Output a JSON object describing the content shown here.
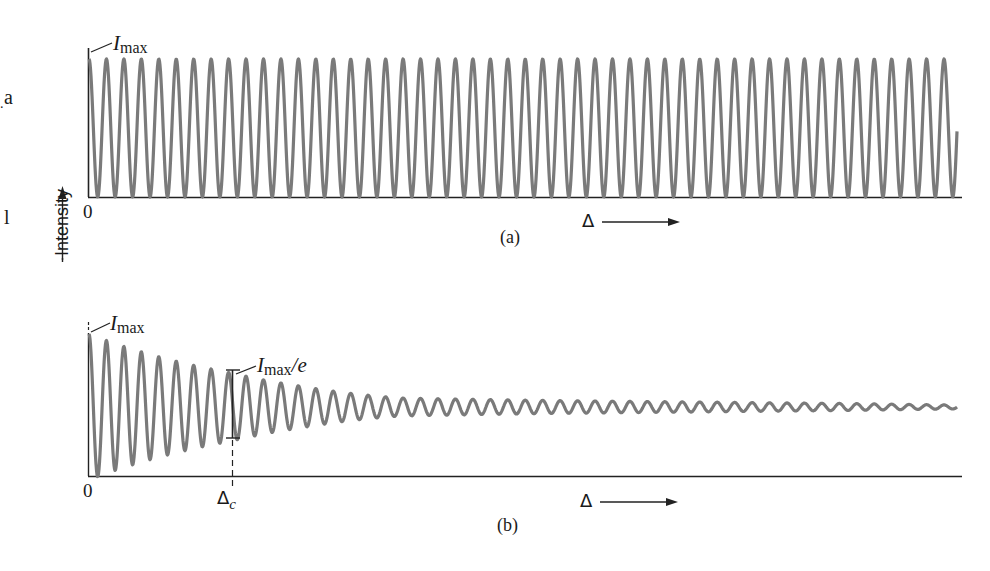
{
  "figure": {
    "y_axis_label": "Intensity",
    "margin_fragments": [
      "a",
      ".",
      "l"
    ],
    "panels": [
      {
        "id": "a",
        "caption": "(a)",
        "origin_label": "0",
        "peak_label": {
          "symbol": "I",
          "subscript": "max",
          "suffix": ""
        },
        "x_axis_label": "Δ",
        "description": "Constant-amplitude fringes"
      },
      {
        "id": "b",
        "caption": "(b)",
        "origin_label": "0",
        "peak_label": {
          "symbol": "I",
          "subscript": "max",
          "suffix": ""
        },
        "decay_label": {
          "symbol": "I",
          "subscript": "max",
          "suffix": "/e"
        },
        "coherence_label": {
          "symbol": "Δ",
          "subscript": "c"
        },
        "x_axis_label": "Δ",
        "description": "Decaying fringe visibility"
      }
    ]
  },
  "chart_data": [
    {
      "type": "line",
      "title": "(a)",
      "xlabel": "Δ",
      "ylabel": "Intensity",
      "annotations": [
        "Imax",
        "0"
      ],
      "grid": false,
      "series": [
        {
          "name": "intensity",
          "function": "I = Imax·(1+cos(2πx/period))/2",
          "period_px": 17.45,
          "amplitude": "constant",
          "cycles": 49.6
        }
      ],
      "pixel_geometry": {
        "x0": 89,
        "x_end": 957,
        "baseline_y": 197,
        "peak_y": 59,
        "end_y": 130
      },
      "color": "#7a7a7a"
    },
    {
      "type": "line",
      "title": "(b)",
      "xlabel": "Δ",
      "ylabel": "Intensity",
      "annotations": [
        "Imax",
        "Imax/e",
        "Δc",
        "0"
      ],
      "grid": false,
      "series": [
        {
          "name": "intensity",
          "function": "I = mean + A(x)·cos(2πx/period)",
          "period_px": 17.45,
          "envelope_px": [
            [
              89,
              73
            ],
            [
              232,
              34
            ],
            [
              300,
              21
            ],
            [
              400,
              9
            ],
            [
              550,
              6.5
            ],
            [
              700,
              5
            ],
            [
              850,
              3.5
            ],
            [
              957,
              2
            ]
          ]
        }
      ],
      "pixel_geometry": {
        "x0": 89,
        "x_end": 957,
        "baseline_y": 476,
        "mean_y": 407,
        "coherence_x": 232,
        "bracket_top_y": 370,
        "bracket_bottom_y": 438
      },
      "color": "#7a7a7a"
    }
  ]
}
